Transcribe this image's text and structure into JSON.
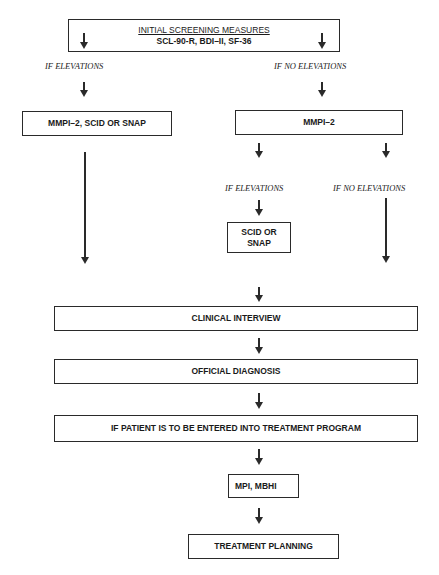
{
  "diagram": {
    "type": "flowchart",
    "nodes": {
      "initial_screening": {
        "title": "INITIAL SCREENING MEASURES",
        "subtitle": "SCL-90-R, BDI–II, SF-36"
      },
      "mmpi_scid_snap": {
        "label": "MMPI–2, SCID OR SNAP"
      },
      "mmpi2": {
        "label": "MMPI–2"
      },
      "scid_snap": {
        "label_line1": "SCID OR",
        "label_line2": "SNAP"
      },
      "clinical_interview": {
        "label": "CLINICAL INTERVIEW"
      },
      "official_diagnosis": {
        "label": "OFFICIAL DIAGNOSIS"
      },
      "treatment_program": {
        "label": "IF PATIENT IS TO BE ENTERED INTO TREATMENT PROGRAM"
      },
      "mpi_mbhi": {
        "label": "MPI, MBHI"
      },
      "treatment_planning": {
        "label": "TREATMENT PLANNING"
      }
    },
    "edge_labels": {
      "left_if_elevations": "IF ELEVATIONS",
      "right_if_no_elevations": "IF NO ELEVATIONS",
      "mid_if_elevations": "IF ELEVATIONS",
      "far_right_if_no_elevations": "IF NO ELEVATIONS"
    },
    "edges": [
      {
        "from": "initial_screening",
        "to": "mmpi_scid_snap",
        "label": "IF ELEVATIONS"
      },
      {
        "from": "initial_screening",
        "to": "mmpi2",
        "label": "IF NO ELEVATIONS"
      },
      {
        "from": "mmpi2",
        "to": "scid_snap",
        "label": "IF ELEVATIONS"
      },
      {
        "from": "mmpi2",
        "to": "clinical_interview",
        "label": "IF NO ELEVATIONS"
      },
      {
        "from": "mmpi_scid_snap",
        "to": "clinical_interview"
      },
      {
        "from": "scid_snap",
        "to": "clinical_interview"
      },
      {
        "from": "clinical_interview",
        "to": "official_diagnosis"
      },
      {
        "from": "official_diagnosis",
        "to": "treatment_program"
      },
      {
        "from": "treatment_program",
        "to": "mpi_mbhi"
      },
      {
        "from": "mpi_mbhi",
        "to": "treatment_planning"
      }
    ],
    "colors": {
      "line": "#2a2a2a",
      "background": "#ffffff",
      "text": "#1a1a1a"
    }
  }
}
